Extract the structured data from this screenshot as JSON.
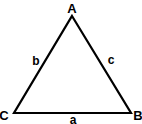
{
  "diagram": {
    "type": "triangle",
    "vertices": {
      "A": {
        "label": "A",
        "x": 72,
        "y": 16
      },
      "B": {
        "label": "B",
        "x": 131,
        "y": 113
      },
      "C": {
        "label": "C",
        "x": 14,
        "y": 113
      }
    },
    "sides": {
      "a": {
        "label": "a",
        "between": "B-C"
      },
      "b": {
        "label": "b",
        "between": "A-C"
      },
      "c": {
        "label": "c",
        "between": "A-B"
      }
    },
    "stroke_color": "#000000",
    "background": "#ffffff"
  }
}
